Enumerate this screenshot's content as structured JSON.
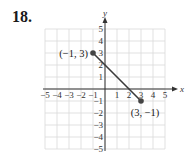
{
  "problem_number": "18.",
  "chart_data": {
    "type": "line",
    "title": "",
    "xlabel": "x",
    "ylabel": "y",
    "xlim": [
      -5,
      5
    ],
    "ylim": [
      -5,
      5
    ],
    "grid": true,
    "x_ticks": [
      "−5",
      "−4",
      "−3",
      "−2",
      "−1",
      "1",
      "2",
      "3",
      "4",
      "5"
    ],
    "y_ticks": [
      "5",
      "4",
      "3",
      "2",
      "1",
      "−1",
      "−2",
      "−3",
      "−4",
      "−5"
    ],
    "series": [
      {
        "name": "segment",
        "points": [
          {
            "x": -1,
            "y": 3
          },
          {
            "x": 3,
            "y": -1
          }
        ]
      }
    ],
    "annotations": [
      {
        "text": "(−1, 3)",
        "x": -1,
        "y": 3
      },
      {
        "text": "(3, −1)",
        "x": 3,
        "y": -1
      }
    ],
    "colors": {
      "line": "#3a3a3a",
      "point": "#444444",
      "grid": "#d9d9d9",
      "axis": "#333333"
    }
  }
}
